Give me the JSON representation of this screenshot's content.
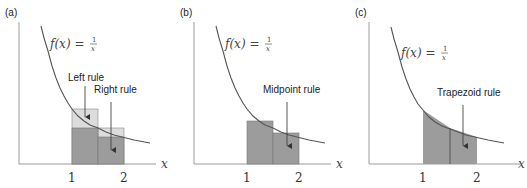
{
  "panels": [
    {
      "id": "a",
      "label": "(a)",
      "function_label": "f(x) = 1/x",
      "f_text": "f(x) =",
      "frac_num": "1",
      "frac_den": "x",
      "x_axis_label": "x",
      "ticks": [
        "1",
        "2"
      ],
      "annotations": [
        "Left rule",
        "Right rule"
      ],
      "method": "left and right Riemann sums, n=2 on [1,2]"
    },
    {
      "id": "b",
      "label": "(b)",
      "f_text": "f(x) =",
      "frac_num": "1",
      "frac_den": "x",
      "x_axis_label": "x",
      "ticks": [
        "1",
        "2"
      ],
      "annotations": [
        "Midpoint rule"
      ],
      "method": "midpoint rule, n=2 on [1,2]"
    },
    {
      "id": "c",
      "label": "(c)",
      "f_text": "f(x) =",
      "frac_num": "1",
      "frac_den": "x",
      "x_axis_label": "x",
      "ticks": [
        "1",
        "2"
      ],
      "annotations": [
        "Trapezoid rule"
      ],
      "method": "trapezoid rule, n=2 on [1,2]"
    }
  ],
  "colors": {
    "dark_fill": "#9c9c9c",
    "light_fill": "#dcdcdc",
    "curve": "#555555",
    "axis": "#9a9a9a"
  }
}
